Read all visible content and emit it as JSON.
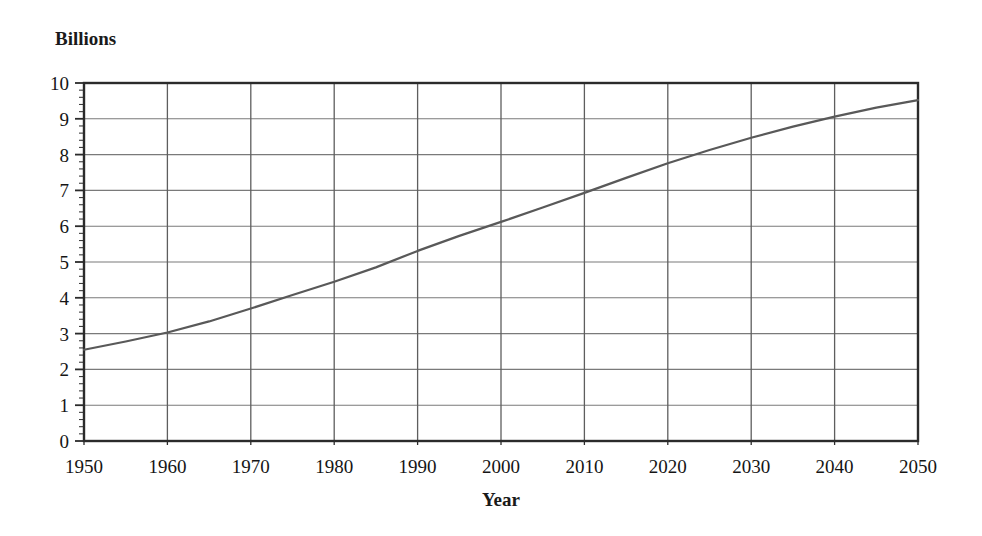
{
  "chart_data": {
    "type": "line",
    "title": "",
    "subtitle": "",
    "xlabel": "Year",
    "ylabel": "Billions",
    "xlim": [
      1950,
      2050
    ],
    "ylim": [
      0,
      10
    ],
    "grid": true,
    "legend": false,
    "legend_position": "none",
    "x_ticks": [
      1950,
      1960,
      1970,
      1980,
      1990,
      2000,
      2010,
      2020,
      2030,
      2040,
      2050
    ],
    "x_tick_labels": [
      "1950",
      "1960",
      "1970",
      "1980",
      "1990",
      "2000",
      "2010",
      "2020",
      "2030",
      "2040",
      "2050"
    ],
    "y_ticks": [
      0,
      1,
      2,
      3,
      4,
      5,
      6,
      7,
      8,
      9,
      10
    ],
    "y_tick_labels": [
      "0",
      "1",
      "2",
      "3",
      "4",
      "5",
      "6",
      "7",
      "8",
      "9",
      "10"
    ],
    "y_minor_ticks_per_interval": 5,
    "series": [
      {
        "name": "World population",
        "color": "#595959",
        "line_width": 2.2,
        "x": [
          1950,
          1955,
          1960,
          1965,
          1970,
          1975,
          1980,
          1985,
          1990,
          1995,
          2000,
          2005,
          2010,
          2015,
          2020,
          2025,
          2030,
          2035,
          2040,
          2045,
          2050
        ],
        "values": [
          2.55,
          2.78,
          3.03,
          3.34,
          3.7,
          4.08,
          4.45,
          4.85,
          5.31,
          5.73,
          6.12,
          6.52,
          6.93,
          7.35,
          7.76,
          8.13,
          8.47,
          8.78,
          9.06,
          9.31,
          9.52
        ]
      }
    ],
    "annotations": []
  },
  "axes": {
    "y_axis_title": "Billions",
    "x_axis_title": "Year"
  }
}
